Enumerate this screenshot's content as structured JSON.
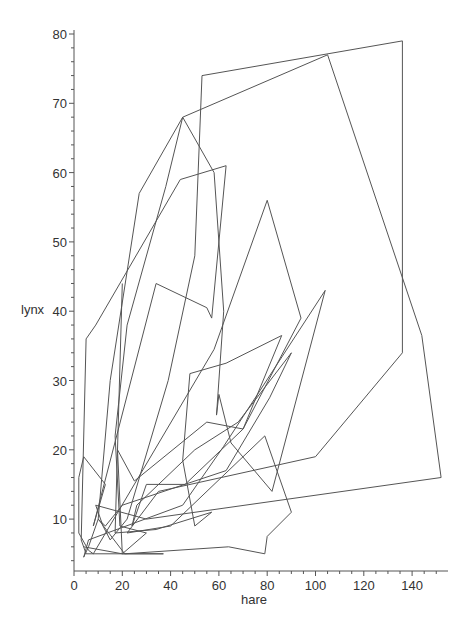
{
  "chart_data": {
    "type": "line",
    "title": "",
    "xlabel": "hare",
    "ylabel": "lynx",
    "xlim": [
      0,
      155
    ],
    "ylim": [
      2.5,
      80
    ],
    "grid": false,
    "legend": null,
    "x_ticks": [
      0,
      20,
      40,
      60,
      80,
      100,
      120,
      140
    ],
    "y_ticks": [
      10,
      20,
      30,
      40,
      50,
      60,
      70,
      80
    ],
    "series": [
      {
        "name": "lynx vs hare",
        "points": [
          [
            20,
            44
          ],
          [
            17,
            8
          ],
          [
            34,
            8.5
          ],
          [
            57,
            11
          ],
          [
            50,
            9
          ],
          [
            45,
            18.5
          ],
          [
            48,
            31
          ],
          [
            63,
            32.5
          ],
          [
            86,
            36.5
          ],
          [
            70,
            23
          ],
          [
            55,
            24
          ],
          [
            25,
            15.5
          ],
          [
            18,
            20
          ],
          [
            20,
            5
          ],
          [
            37,
            5
          ],
          [
            5,
            5
          ],
          [
            3,
            7
          ],
          [
            5,
            36
          ],
          [
            9,
            38
          ],
          [
            44,
            59
          ],
          [
            63,
            61
          ],
          [
            57,
            39
          ],
          [
            55,
            40.5
          ],
          [
            34,
            44
          ],
          [
            8,
            9
          ],
          [
            13,
            15
          ],
          [
            4,
            19
          ],
          [
            2,
            16
          ],
          [
            2,
            8
          ],
          [
            6,
            5.5
          ],
          [
            8,
            5
          ],
          [
            58,
            34.5
          ],
          [
            80,
            56
          ],
          [
            94,
            39
          ],
          [
            70,
            23
          ],
          [
            46,
            15
          ],
          [
            30,
            15
          ],
          [
            24,
            9
          ],
          [
            26,
            12
          ],
          [
            50,
            20
          ],
          [
            68,
            24
          ],
          [
            90,
            34
          ],
          [
            81,
            27.5
          ],
          [
            63,
            17
          ],
          [
            20,
            12
          ],
          [
            13,
            9
          ],
          [
            10,
            10
          ],
          [
            6,
            6
          ],
          [
            4,
            4.5
          ],
          [
            6,
            7
          ],
          [
            45,
            12
          ],
          [
            62,
            20.5
          ],
          [
            104,
            43
          ],
          [
            82,
            14
          ],
          [
            65,
            21
          ],
          [
            60,
            28
          ],
          [
            59,
            25
          ],
          [
            62,
            40
          ],
          [
            58,
            60
          ],
          [
            45,
            68
          ],
          [
            27,
            57
          ],
          [
            15,
            30
          ],
          [
            10,
            10
          ],
          [
            21,
            5
          ],
          [
            64,
            6
          ],
          [
            79,
            5
          ],
          [
            80,
            7.5
          ],
          [
            90,
            11
          ],
          [
            79,
            22
          ],
          [
            40,
            9
          ],
          [
            22,
            8
          ],
          [
            35,
            14
          ],
          [
            100,
            19
          ],
          [
            136,
            34
          ],
          [
            136,
            79
          ],
          [
            53,
            74
          ],
          [
            50,
            48
          ],
          [
            39,
            30
          ],
          [
            22,
            10
          ],
          [
            15,
            7
          ],
          [
            12,
            9
          ],
          [
            9,
            12
          ],
          [
            30,
            10
          ],
          [
            152,
            16
          ],
          [
            144,
            36.5
          ],
          [
            105,
            77
          ],
          [
            45,
            68
          ],
          [
            38,
            58
          ],
          [
            22,
            38
          ],
          [
            17,
            22
          ],
          [
            19,
            9
          ],
          [
            30,
            8
          ],
          [
            20,
            5
          ],
          [
            4,
            6
          ]
        ]
      }
    ]
  }
}
